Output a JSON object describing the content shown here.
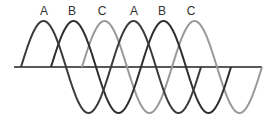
{
  "diagram": {
    "labels": [
      {
        "text": "A",
        "x": 44
      },
      {
        "text": "B",
        "x": 72
      },
      {
        "text": "C",
        "x": 102
      },
      {
        "text": "A",
        "x": 134
      },
      {
        "text": "B",
        "x": 162
      },
      {
        "text": "C",
        "x": 191
      }
    ],
    "axis": {
      "y": 67,
      "x_start": 14,
      "x_end": 262,
      "color": "#222222"
    },
    "waves": [
      {
        "name": "A",
        "start_x": 21,
        "end_x": 201,
        "color": "#3a3a3a"
      },
      {
        "name": "B",
        "start_x": 51,
        "end_x": 231,
        "color": "#2e2e2e"
      },
      {
        "name": "C",
        "start_x": 82,
        "end_x": 262,
        "color": "#999999"
      }
    ],
    "period_px": 90,
    "amplitude_px": 46
  }
}
